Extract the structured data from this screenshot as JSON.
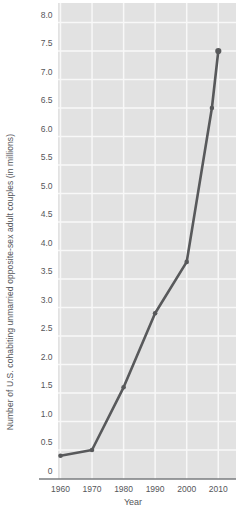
{
  "chart_data": {
    "type": "line",
    "title": "",
    "xlabel": "Year",
    "ylabel": "Number of U.S. cohabiting unmarried opposite-sex adult couples (in millions)",
    "x": [
      1960,
      1970,
      1980,
      1990,
      2000,
      2008,
      2010
    ],
    "y": [
      0.4,
      0.5,
      1.6,
      2.9,
      3.8,
      6.5,
      7.5
    ],
    "series": [
      {
        "name": "U.S. cohabiting unmarried opposite-sex adult couples (millions)",
        "x": [
          1960,
          1970,
          1980,
          1990,
          2000,
          2008,
          2010
        ],
        "y": [
          0.4,
          0.5,
          1.6,
          2.9,
          3.8,
          6.5,
          7.5
        ]
      }
    ],
    "xticks": [
      1960,
      1970,
      1980,
      1990,
      2000,
      2010
    ],
    "xtick_labels": [
      "1960",
      "1970",
      "1980",
      "1990",
      "2000",
      "2010"
    ],
    "ytick_values": [
      0,
      0.5,
      1.0,
      1.5,
      2.0,
      2.5,
      3.0,
      3.5,
      4.0,
      4.5,
      5.0,
      5.5,
      6.0,
      6.5,
      7.0,
      7.5,
      8.0
    ],
    "ytick_labels": [
      "0",
      "0.5",
      "1.0",
      "1.5",
      "2.0",
      "2.5",
      "3.0",
      "3.5",
      "4.0",
      "4.5",
      "5.0",
      "5.5",
      "6.0",
      "6.5",
      "7.0",
      "7.5",
      "8.0"
    ],
    "xlim": [
      1959.2,
      2015.6
    ],
    "ylim": [
      0,
      8.35
    ],
    "grid": true,
    "legend": false,
    "colors": {
      "page_background": "#ffffff",
      "plot_background": "#e2e2e2",
      "gridline": "#f8f8f8",
      "line": "#58595b",
      "marker": "#58595b",
      "axis_line": "#7a7c7f",
      "text": "#55565a"
    }
  }
}
